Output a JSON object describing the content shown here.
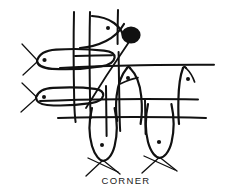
{
  "figure": {
    "kind": "line-drawing",
    "title_caption": "CORNER",
    "alt_description": "Hand-drawn black ink line drawing: several fish shapes woven through a grid of crossing lines, with a filled black blob and a diagonal line at the upper right.",
    "background_color": "#ffffff",
    "ink_color": "#111111",
    "stroke_width_main": 2.1,
    "stroke_width_thin": 1.3,
    "canvas": {
      "width": 230,
      "height": 193
    }
  },
  "caption": {
    "label": "CORNER",
    "x": 126,
    "y": 183,
    "color": "#1a1a1a"
  },
  "elements": {
    "grid_lines": {
      "name": "net-grid",
      "vertical_count": 5,
      "horizontal_count": 4,
      "note": "long crossing strokes forming an irregular hand-drawn net"
    },
    "fish": [
      {
        "name": "fish-upper-left",
        "orientation": "horizontal-left",
        "eye_x": 44,
        "eye_y": 60,
        "has_tail_fin": true
      },
      {
        "name": "fish-lower-left",
        "orientation": "horizontal-left",
        "eye_x": 44,
        "eye_y": 97,
        "has_tail_fin": true
      },
      {
        "name": "fish-top-center",
        "orientation": "vertical-up",
        "eye_x": 108,
        "eye_y": 28,
        "has_tail_fin": false
      },
      {
        "name": "fish-mid-center",
        "orientation": "vertical-down",
        "eye_x": 128,
        "eye_y": 78,
        "has_tail_fin": false
      },
      {
        "name": "fish-mid-right",
        "orientation": "vertical-down",
        "eye_x": 188,
        "eye_y": 79,
        "has_tail_fin": false
      },
      {
        "name": "fish-bottom-left",
        "orientation": "vertical-down",
        "eye_x": 102,
        "eye_y": 145,
        "has_tail_fin": true
      },
      {
        "name": "fish-bottom-right",
        "orientation": "vertical-down",
        "eye_x": 159,
        "eye_y": 142,
        "has_tail_fin": true
      }
    ],
    "blob": {
      "name": "ink-blob",
      "cx": 131,
      "cy": 35,
      "rx": 9.5,
      "ry": 8.5,
      "fill": "#111111"
    },
    "diagonal": {
      "name": "diagonal-line",
      "x1": 129,
      "y1": 42,
      "x2": 86,
      "y2": 108
    }
  }
}
